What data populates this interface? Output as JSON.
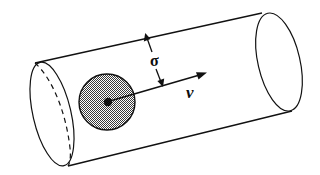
{
  "figure": {
    "name": "collision-cylinder-diagram",
    "background_color": "#ffffff",
    "stroke_color": "#111111",
    "sphere_fill_color": "#808080",
    "width": 320,
    "height": 175
  },
  "labels": {
    "cross_section": "σ",
    "velocity": "v"
  },
  "elements": {
    "cylinder_label": "collision cylinder",
    "left_cap_label": "left end ellipse",
    "right_cap_label": "right end ellipse",
    "hidden_edge_label": "hidden back edge (dashed)",
    "sphere_label": "shaded particle disk",
    "center_dot_label": "particle center point",
    "velocity_arrow_label": "velocity vector arrow",
    "radius_dimension_label": "cross-section radius dimension arrow"
  },
  "geometry": {
    "top_edge": {
      "x1": 35,
      "y1": 63,
      "x2": 262,
      "y2": 13
    },
    "bottom_edge": {
      "x1": 68,
      "y1": 166,
      "x2": 292,
      "y2": 111
    },
    "left_cap": {
      "cx": 52,
      "cy": 114,
      "rx": 19,
      "ry": 53,
      "rotate": -13
    },
    "right_cap": {
      "cx": 279,
      "cy": 62,
      "rx": 21,
      "ry": 50,
      "rotate": -13
    },
    "sphere": {
      "cx": 107,
      "cy": 102,
      "r": 28
    },
    "center_dot": {
      "cx": 108,
      "cy": 102,
      "r": 4
    },
    "velocity_arrow": {
      "x1": 110,
      "y1": 101,
      "x2": 206,
      "y2": 73
    },
    "sigma_arrow_up": {
      "x1": 152,
      "y1": 51,
      "x2": 146,
      "y2": 34
    },
    "sigma_arrow_down": {
      "x1": 155,
      "y1": 68,
      "x2": 162,
      "y2": 86
    },
    "sigma_label_pos": {
      "x": 155,
      "y": 65
    },
    "velocity_label_pos": {
      "x": 191,
      "y": 96
    }
  }
}
